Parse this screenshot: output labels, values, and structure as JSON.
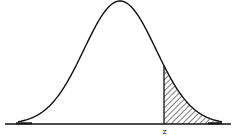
{
  "chart_data": {
    "type": "area",
    "title": "",
    "xlabel": "",
    "ylabel": "",
    "grid": false,
    "legend": null,
    "annotations": [
      {
        "text": "z",
        "position": "x-axis below shaded boundary"
      }
    ],
    "curve": "normal-pdf",
    "mean": 0,
    "sd": 1,
    "shaded_region": {
      "from": "z",
      "to": "+inf",
      "style": "diagonal hatch"
    },
    "z_approx": 1.2
  },
  "labels": {
    "z": "z"
  },
  "colors": {
    "stroke": "#111111",
    "background": "#ffffff"
  }
}
